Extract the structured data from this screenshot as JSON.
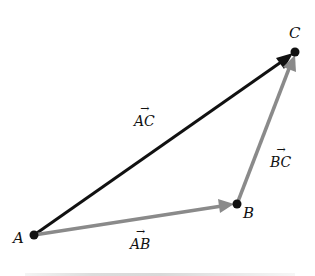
{
  "diagram": {
    "points": [
      {
        "name": "A",
        "x": 34,
        "y": 235
      },
      {
        "name": "B",
        "x": 237,
        "y": 204
      },
      {
        "name": "C",
        "x": 295,
        "y": 52
      }
    ],
    "vectors": [
      {
        "label": "AC",
        "from": "A",
        "to": "C",
        "color": "#111111"
      },
      {
        "label": "AB",
        "from": "A",
        "to": "B",
        "color": "#8a8a8a"
      },
      {
        "label": "BC",
        "from": "B",
        "to": "C",
        "color": "#8a8a8a"
      }
    ],
    "labels": {
      "A": "A",
      "B": "B",
      "C": "C",
      "AC": "AC",
      "AB": "AB",
      "BC": "BC",
      "arrow": "→"
    }
  }
}
